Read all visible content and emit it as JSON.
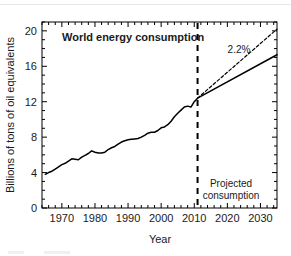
{
  "figure": {
    "title": "World energy consumption",
    "annotation_growth": "2.2%",
    "projected_label_line1": "Projected",
    "projected_label_line2": "consumption"
  },
  "chart_data": {
    "type": "line",
    "title": "World energy consumption",
    "xlabel": "Year",
    "ylabel": "Billions of tons of oil equivalents",
    "xlim": [
      1964,
      2035
    ],
    "ylim": [
      0,
      21
    ],
    "xticks": [
      1970,
      1980,
      1990,
      2000,
      2010,
      2020,
      2030
    ],
    "xtick_labels": [
      "1970",
      "1980",
      "1990",
      "2000",
      "2010",
      "2020",
      "2030"
    ],
    "x_minor_tick_step": 2,
    "yticks": [
      0,
      4,
      8,
      12,
      16,
      20
    ],
    "ytick_labels": [
      "0",
      "4",
      "8",
      "12",
      "16",
      "20"
    ],
    "y_minor_tick_step": 1,
    "grid": false,
    "legend": null,
    "ticks_direction": "in",
    "ticks_on_all_sides": true,
    "divider_year": 2011,
    "divider_style": "dashed-vertical",
    "annotations": [
      {
        "text": "World energy consumption",
        "x": 1977,
        "y": 19.0,
        "bold": true
      },
      {
        "text": "2.2%",
        "x": 2026,
        "y": 17.9,
        "bold": false
      },
      {
        "text": "Projected",
        "x": 2024,
        "y": 3.1,
        "bold": false
      },
      {
        "text": "consumption",
        "x": 2024,
        "y": 1.9,
        "bold": false
      }
    ],
    "series": [
      {
        "name": "Historical consumption",
        "style": "solid",
        "x": [
          1965,
          1966,
          1967,
          1968,
          1969,
          1970,
          1971,
          1972,
          1973,
          1974,
          1975,
          1976,
          1977,
          1978,
          1979,
          1980,
          1981,
          1982,
          1983,
          1984,
          1985,
          1986,
          1987,
          1988,
          1989,
          1990,
          1991,
          1992,
          1993,
          1994,
          1995,
          1996,
          1997,
          1998,
          1999,
          2000,
          2001,
          2002,
          2003,
          2004,
          2005,
          2006,
          2007,
          2008,
          2009,
          2010,
          2011
        ],
        "y": [
          3.8,
          4.0,
          4.15,
          4.4,
          4.65,
          4.9,
          5.05,
          5.3,
          5.55,
          5.5,
          5.45,
          5.75,
          5.95,
          6.15,
          6.45,
          6.3,
          6.2,
          6.2,
          6.3,
          6.6,
          6.8,
          6.95,
          7.2,
          7.45,
          7.6,
          7.7,
          7.75,
          7.8,
          7.85,
          8.0,
          8.2,
          8.45,
          8.55,
          8.55,
          8.75,
          9.05,
          9.15,
          9.4,
          9.8,
          10.3,
          10.7,
          11.05,
          11.4,
          11.5,
          11.4,
          12.0,
          12.4
        ]
      },
      {
        "name": "Projected consumption (base)",
        "style": "solid",
        "x": [
          2011,
          2035
        ],
        "y": [
          12.4,
          17.3
        ]
      },
      {
        "name": "Projected consumption (2.2% growth)",
        "style": "dashed",
        "x": [
          2011,
          2035
        ],
        "y": [
          12.4,
          20.2
        ]
      }
    ]
  }
}
